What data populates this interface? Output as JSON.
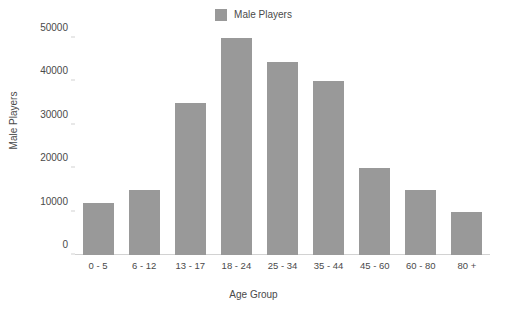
{
  "chart_data": {
    "type": "bar",
    "title": "",
    "xlabel": "Age Group",
    "ylabel": "Male Players",
    "categories": [
      "0 - 5",
      "6 - 12",
      "13 - 17",
      "18 - 24",
      "25 - 34",
      "35 - 44",
      "45 - 60",
      "60 - 80",
      "80 +"
    ],
    "series": [
      {
        "name": "Male Players",
        "color": "#999999",
        "values": [
          12000,
          15000,
          35000,
          50000,
          44500,
          40000,
          20000,
          15000,
          10000
        ]
      }
    ],
    "ylim": [
      0,
      50000
    ],
    "yticks": [
      0,
      10000,
      20000,
      30000,
      40000,
      50000
    ],
    "ytick_labels": [
      "0",
      "10000",
      "20000",
      "30000",
      "40000",
      "50000"
    ],
    "grid": false,
    "legend": {
      "position": "top-center",
      "entries": [
        {
          "label": "Male Players",
          "color": "#999999"
        }
      ]
    },
    "background_color": "#ffffff",
    "axis_color": "#d2d2d2",
    "text_color": "#4a4a4a"
  }
}
